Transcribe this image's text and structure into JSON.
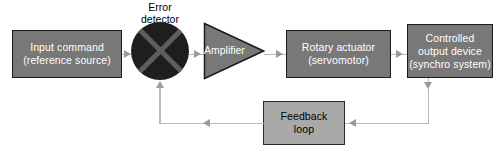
{
  "diagram": {
    "colors": {
      "background": "#ffffff",
      "block_fill": "#787878",
      "block_border": "#1c1c1c",
      "block_text": "#ffffff",
      "feedback_fill": "#a9a9a9",
      "feedback_text": "#000000",
      "detector_fill": "#1e1e1e",
      "detector_cross": "#5e5e5e",
      "connector": "#b9b9b9",
      "arrowhead": "#9a9a9a"
    },
    "blocks": {
      "input_command": {
        "line1": "Input command",
        "line2": "(reference source)"
      },
      "error_detector": {
        "caption_line1": "Error",
        "caption_line2": "detector"
      },
      "amplifier": {
        "label": "Amplifier"
      },
      "rotary_actuator": {
        "line1": "Rotary actuator",
        "line2": "(servomotor)"
      },
      "controlled_output": {
        "line1": "Controlled",
        "line2": "output device",
        "line3": "(synchro system)"
      },
      "feedback_loop": {
        "line1": "Feedback",
        "line2": "loop"
      }
    },
    "connectors": [
      {
        "name": "input-to-detector",
        "direction": "right"
      },
      {
        "name": "detector-to-amplifier",
        "direction": "right"
      },
      {
        "name": "amplifier-to-actuator",
        "direction": "right"
      },
      {
        "name": "actuator-to-output",
        "direction": "right"
      },
      {
        "name": "output-down-tap",
        "direction": "down"
      },
      {
        "name": "output-to-feedback",
        "direction": "left"
      },
      {
        "name": "feedback-to-detector",
        "direction": "left"
      },
      {
        "name": "feedback-into-detector",
        "direction": "up"
      }
    ]
  }
}
